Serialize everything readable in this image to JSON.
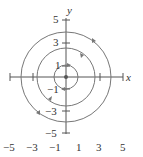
{
  "diagram": {
    "type": "phase_portrait",
    "axes": {
      "x_label": "x",
      "y_label": "y",
      "x_ticks": [
        "-5",
        "-3",
        "-1",
        "1",
        "3",
        "5"
      ],
      "y_ticks": [
        "5",
        "3",
        "1",
        "-1",
        "-3",
        "-5"
      ]
    },
    "orbits": [
      {
        "radius": 1,
        "direction": "clockwise"
      },
      {
        "radius": 3,
        "direction": "clockwise"
      },
      {
        "radius": 4.5,
        "direction": "clockwise"
      }
    ],
    "colors": {
      "axis": "#555555",
      "orbit": "#777777",
      "text": "#333333"
    }
  },
  "labels": {
    "x": "x",
    "y": "y",
    "yt5": "5",
    "yt3": "3",
    "yt1": "1",
    "ytm1": "−1",
    "ytm3": "−3",
    "ytm5": "−5",
    "xtm5": "−5",
    "xtm3": "−3",
    "xtm1": "−1",
    "xt1": "1",
    "xt3": "3",
    "xt5": "5"
  }
}
